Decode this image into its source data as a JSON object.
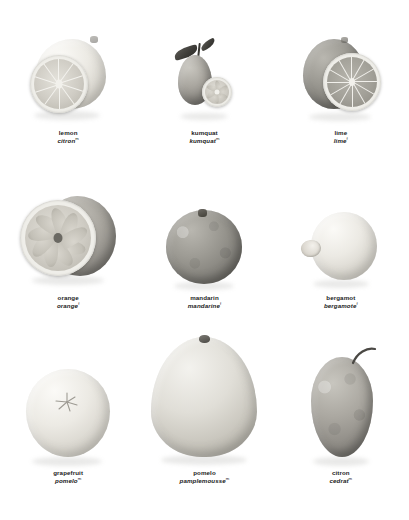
{
  "plate": {
    "title": "Citrus fruits identification plate",
    "background_color": "#ffffff",
    "columns": 3,
    "rows": 3,
    "language_primary": "English",
    "language_secondary": "French"
  },
  "items": [
    {
      "id": "lemon",
      "name_en": "lemon",
      "name_fr": "citron",
      "footnote_mark": "m",
      "depiction": "whole lemon behind a cut half showing radial flesh",
      "tone": "pale"
    },
    {
      "id": "kumquat",
      "name_en": "kumquat",
      "name_fr": "kumquat",
      "footnote_mark": "m",
      "depiction": "oval kumquat with leaf and stem beside a cut slice",
      "tone": "mid"
    },
    {
      "id": "lime",
      "name_en": "lime",
      "name_fr": "lime",
      "footnote_mark": "f",
      "depiction": "whole lime behind a cut half showing radial flesh",
      "tone": "dark"
    },
    {
      "id": "orange",
      "name_en": "orange",
      "name_fr": "orange",
      "footnote_mark": "f",
      "depiction": "cut orange half with wedge segments in front of whole fruit",
      "tone": "mid"
    },
    {
      "id": "mandarin",
      "name_en": "mandarin",
      "name_fr": "mandarine",
      "footnote_mark": "f",
      "depiction": "whole round mandarin with dimpled stem end",
      "tone": "dark"
    },
    {
      "id": "bergamot",
      "name_en": "bergamot",
      "name_fr": "bergamote",
      "footnote_mark": "f",
      "depiction": "pale round bergamot with protruding nipple",
      "tone": "pale"
    },
    {
      "id": "grapefruit",
      "name_en": "grapefruit",
      "name_fr": "pomelo",
      "footnote_mark": "m",
      "depiction": "large pale grapefruit with star-shaped stem scar",
      "tone": "pale"
    },
    {
      "id": "pomelo",
      "name_en": "pomelo",
      "name_fr": "pamplemousse",
      "footnote_mark": "m",
      "depiction": "large teardrop pomelo with small stem at top",
      "tone": "pale"
    },
    {
      "id": "citron",
      "name_en": "citron",
      "name_fr": "cedrat",
      "footnote_mark": "m",
      "depiction": "knobbly oblong citron with curved stem",
      "tone": "mid"
    }
  ]
}
